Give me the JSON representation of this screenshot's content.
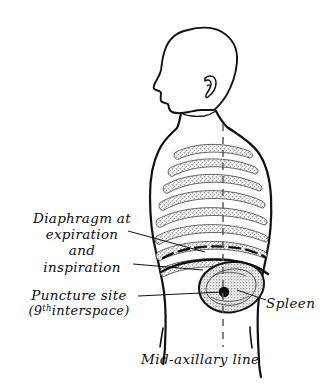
{
  "figure": {
    "background_color": "#ffffff",
    "ink_color": "#111111",
    "width": 336,
    "height": 389
  },
  "labels": {
    "diaphragm": {
      "line1": "Diaphragm at",
      "line2": "expiration",
      "line3": "and",
      "line4": "inspiration"
    },
    "puncture": {
      "line1": "Puncture  site",
      "line2_prefix": "(9",
      "line2_sup": "th",
      "line2_suffix": "interspace)"
    },
    "spleen": "Spleen",
    "mid_axillary": "Mid-axillary line"
  },
  "anatomy": {
    "parts": [
      "head-profile",
      "neck",
      "shoulder",
      "torso-outline",
      "rib-cage",
      "diaphragm-expiration-line",
      "diaphragm-inspiration-line",
      "spleen-organ",
      "puncture-point"
    ],
    "rib_count": 8,
    "diaphragm_expiration_style": "dashed",
    "diaphragm_inspiration_style": "solid",
    "mid_axillary_line_style": "dashed-vertical"
  }
}
